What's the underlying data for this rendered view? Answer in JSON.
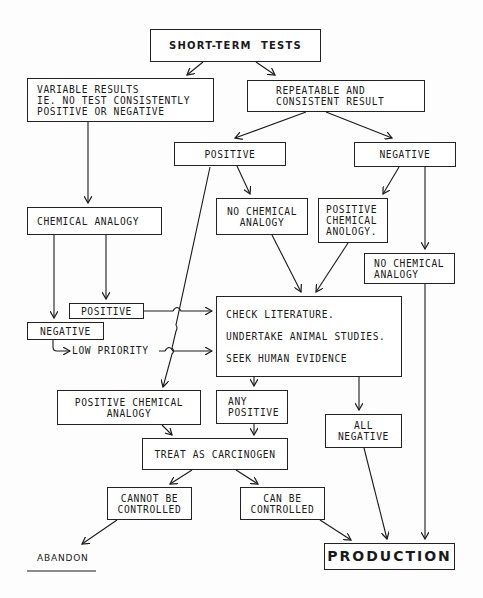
{
  "diagram": {
    "nodes": {
      "short_term_tests": "SHORT-TERM  TESTS",
      "variable_results": "VARIABLE RESULTS\nIE. NO TEST CONSISTENTLY\nPOSITIVE OR NEGATIVE",
      "repeatable": "REPEATABLE AND\nCONSISTENT RESULT",
      "positive": "POSITIVE",
      "negative": "NEGATIVE",
      "chemical_analogy": "CHEMICAL ANALOGY",
      "no_chem_analogy_mid": "NO CHEMICAL\nANALOGY",
      "positive_chem_anology": "POSITIVE\nCHEMICAL\nANOLOGY.",
      "no_chem_analogy_right": "NO CHEMICAL\nANALOGY",
      "positive_small": "POSITIVE",
      "negative_small": "NEGATIVE",
      "low_priority": "LOW PRIORITY",
      "check_literature": {
        "line1": "CHECK LITERATURE.",
        "line2": "UNDERTAKE ANIMAL STUDIES.",
        "line3": "SEEK HUMAN EVIDENCE"
      },
      "positive_chemical_analogy": "POSITIVE CHEMICAL\nANALOGY",
      "any_positive": "ANY\nPOSITIVE",
      "all_negative": "ALL\nNEGATIVE",
      "treat_as_carcinogen": "TREAT AS CARCINOGEN",
      "cannot_be_controlled": "CANNOT BE\nCONTROLLED",
      "can_be_controlled": "CAN BE\nCONTROLLED",
      "abandon": "ABANDON",
      "production": "PRODUCTION"
    },
    "colors": {
      "ink": "#1a1a1a",
      "paper": "#fdfdfd"
    }
  }
}
